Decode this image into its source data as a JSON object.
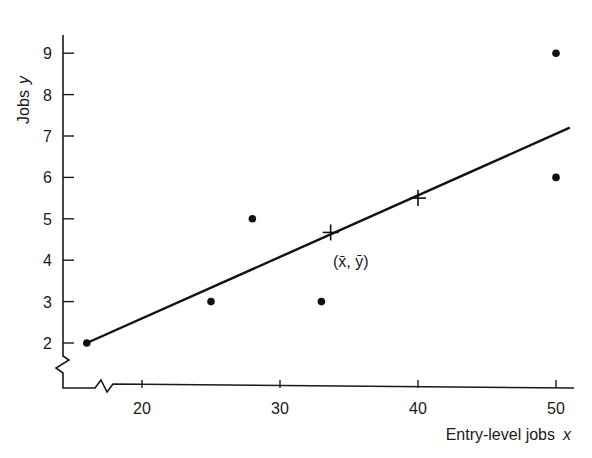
{
  "chart_data": {
    "type": "scatter",
    "title": "",
    "xlabel": "Entry-level jobs",
    "xlabel_var": "x",
    "ylabel": "Jobs",
    "ylabel_var": "y",
    "xlim": [
      14,
      51
    ],
    "ylim": [
      1,
      9.3
    ],
    "x_ticks": [
      20,
      30,
      40,
      50
    ],
    "y_ticks": [
      2,
      3,
      4,
      5,
      6,
      7,
      8,
      9
    ],
    "axis_breaks": true,
    "grid": false,
    "points": [
      {
        "x": 16,
        "y": 2
      },
      {
        "x": 25,
        "y": 3
      },
      {
        "x": 28,
        "y": 5
      },
      {
        "x": 33,
        "y": 3
      },
      {
        "x": 50,
        "y": 6
      },
      {
        "x": 50,
        "y": 9
      }
    ],
    "regression_line": {
      "x_start": 16,
      "y_start": 2,
      "x_end": 51,
      "y_end": 7.2
    },
    "markers": [
      {
        "x": 33.67,
        "y": 4.67,
        "label": "(x̄, ȳ)"
      },
      {
        "x": 40,
        "y": 5.5,
        "label": ""
      }
    ],
    "annotation": "(x̄, ȳ)"
  }
}
